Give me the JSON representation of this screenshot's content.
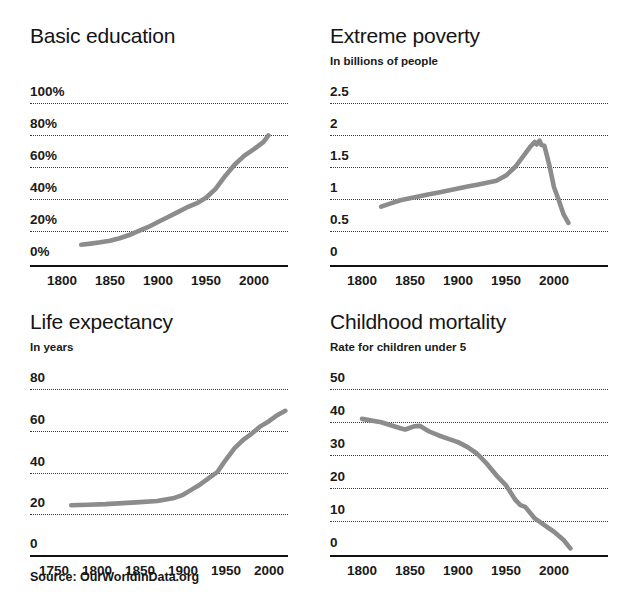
{
  "source_note": "Source: OurWorldinData.org",
  "colors": {
    "line": "#8c8c8c",
    "axis": "#111111",
    "grid": "#3a3a3a",
    "text": "#1a1a1a",
    "background": "#ffffff"
  },
  "chart_data": [
    {
      "type": "line",
      "id": "basic-education",
      "title": "Basic education",
      "subtitle": "",
      "xlabel": "",
      "ylabel": "",
      "grid": true,
      "legend": "none",
      "xlim": [
        1800,
        2030
      ],
      "ylim": [
        0,
        100
      ],
      "xticks": [
        1800,
        1850,
        1900,
        1950,
        2000
      ],
      "xticklabels": [
        "1800",
        "1850",
        "1900",
        "1950",
        "2000"
      ],
      "yticks": [
        0,
        20,
        40,
        60,
        80,
        100
      ],
      "yticklabels": [
        "0%",
        "20%",
        "40%",
        "60%",
        "80%",
        "100%"
      ],
      "x": [
        1820,
        1830,
        1840,
        1850,
        1860,
        1870,
        1880,
        1890,
        1900,
        1910,
        1920,
        1930,
        1940,
        1950,
        1960,
        1970,
        1980,
        1990,
        2000,
        2010,
        2015
      ],
      "values": [
        12.5,
        13.2,
        14.0,
        15.0,
        16.5,
        18.5,
        21.0,
        23.5,
        26.5,
        29.5,
        32.5,
        35.5,
        38.0,
        41.5,
        47.0,
        55.0,
        62.0,
        67.5,
        71.5,
        76.0,
        80.0
      ]
    },
    {
      "type": "line",
      "id": "extreme-poverty",
      "title": "Extreme poverty",
      "subtitle": "In billions of people",
      "xlabel": "",
      "ylabel": "In billions of people",
      "grid": true,
      "legend": "none",
      "xlim": [
        1800,
        2030
      ],
      "ylim": [
        0,
        2.5
      ],
      "xticks": [
        1800,
        1850,
        1900,
        1950,
        2000
      ],
      "xticklabels": [
        "1800",
        "1850",
        "1900",
        "1950",
        "2000"
      ],
      "yticks": [
        0,
        0.5,
        1,
        1.5,
        2,
        2.5
      ],
      "yticklabels": [
        "0",
        "0.5",
        "1",
        "1.5",
        "2",
        "2.5"
      ],
      "x": [
        1820,
        1830,
        1840,
        1850,
        1860,
        1870,
        1880,
        1890,
        1900,
        1910,
        1920,
        1930,
        1940,
        1950,
        1960,
        1970,
        1975,
        1980,
        1982,
        1985,
        1987,
        1990,
        1995,
        2000,
        2005,
        2010,
        2015
      ],
      "values": [
        0.9,
        0.95,
        1.0,
        1.03,
        1.06,
        1.09,
        1.12,
        1.15,
        1.18,
        1.21,
        1.24,
        1.27,
        1.3,
        1.38,
        1.52,
        1.72,
        1.82,
        1.9,
        1.86,
        1.92,
        1.85,
        1.84,
        1.55,
        1.2,
        1.0,
        0.78,
        0.65
      ]
    },
    {
      "type": "line",
      "id": "life-expectancy",
      "title": "Life expectancy",
      "subtitle": "In years",
      "xlabel": "",
      "ylabel": "In years",
      "grid": true,
      "legend": "none",
      "xlim": [
        1750,
        2030
      ],
      "ylim": [
        0,
        80
      ],
      "xticks": [
        1750,
        1800,
        1850,
        1900,
        1950,
        2000
      ],
      "xticklabels": [
        "1750",
        "1800",
        "1850",
        "1900",
        "1950",
        "2000"
      ],
      "yticks": [
        0,
        20,
        40,
        60,
        80
      ],
      "yticklabels": [
        "0",
        "20",
        "40",
        "60",
        "80"
      ],
      "x": [
        1770,
        1790,
        1810,
        1830,
        1850,
        1870,
        1890,
        1900,
        1910,
        1920,
        1930,
        1940,
        1950,
        1960,
        1970,
        1980,
        1990,
        2000,
        2010,
        2019
      ],
      "values": [
        24.0,
        24.2,
        24.5,
        25.0,
        25.5,
        26.0,
        27.5,
        29.0,
        31.5,
        34.0,
        37.0,
        40.0,
        46.0,
        51.5,
        55.5,
        58.5,
        62.0,
        64.5,
        67.5,
        69.5
      ]
    },
    {
      "type": "line",
      "id": "childhood-mortality",
      "title": "Childhood mortality",
      "subtitle": "Rate for children under 5",
      "xlabel": "",
      "ylabel": "Rate for children under 5",
      "grid": true,
      "legend": "none",
      "xlim": [
        1800,
        2030
      ],
      "ylim": [
        0,
        50
      ],
      "xticks": [
        1800,
        1850,
        1900,
        1950,
        2000
      ],
      "xticklabels": [
        "1800",
        "1850",
        "1900",
        "1950",
        "2000"
      ],
      "yticks": [
        0,
        10,
        20,
        30,
        40,
        50
      ],
      "yticklabels": [
        "0",
        "10",
        "20",
        "30",
        "40",
        "50"
      ],
      "x": [
        1800,
        1820,
        1840,
        1845,
        1855,
        1860,
        1870,
        1880,
        1890,
        1900,
        1910,
        1920,
        1930,
        1940,
        1950,
        1960,
        1965,
        1970,
        1980,
        1990,
        2000,
        2010,
        2017
      ],
      "values": [
        41.0,
        40.0,
        38.2,
        37.8,
        38.8,
        38.9,
        37.2,
        36.0,
        35.0,
        34.0,
        32.5,
        30.5,
        27.5,
        24.0,
        21.0,
        16.5,
        15.0,
        14.5,
        11.0,
        9.0,
        7.0,
        4.5,
        2.0
      ]
    }
  ]
}
